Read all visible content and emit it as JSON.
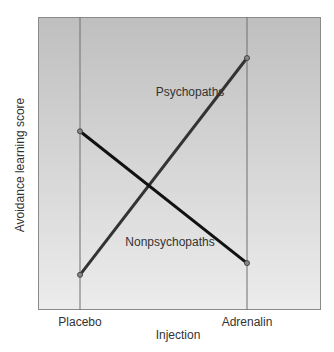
{
  "chart_data": {
    "type": "line",
    "title": "",
    "xlabel": "Injection",
    "ylabel": "Avoidance learning score",
    "categories": [
      "Placebo",
      "Adrenalin"
    ],
    "series": [
      {
        "name": "Psychopaths",
        "values": [
          12,
          86
        ],
        "color": "#333333"
      },
      {
        "name": "Nonpsychopaths",
        "values": [
          61,
          16
        ],
        "color": "#111111"
      }
    ],
    "ylim": [
      0,
      100
    ],
    "y_ticks_shown": false,
    "grid": "vertical lines at categories",
    "legend": "inline labels"
  },
  "labels": {
    "psychopaths": "Psychopaths",
    "nonpsychopaths": "Nonpsychopaths",
    "placebo": "Placebo",
    "adrenalin": "Adrenalin",
    "xlabel": "Injection",
    "ylabel": "Avoidance learning score"
  }
}
